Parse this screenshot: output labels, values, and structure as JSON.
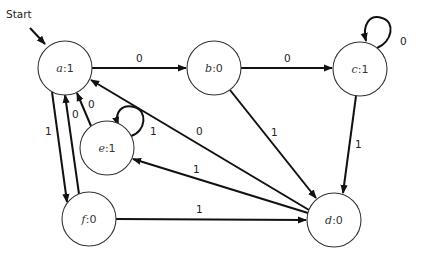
{
  "diagram": {
    "type": "finite-state-machine",
    "start": {
      "label": "Start",
      "target": "a"
    },
    "nodes": [
      {
        "id": "a",
        "name": "a",
        "output": "1",
        "text": ":1",
        "cx": 65,
        "cy": 68
      },
      {
        "id": "b",
        "name": "b",
        "output": "0",
        "text": ":0",
        "cx": 214,
        "cy": 68
      },
      {
        "id": "c",
        "name": "c",
        "output": "1",
        "text": ":1",
        "cx": 360,
        "cy": 69
      },
      {
        "id": "e",
        "name": "e",
        "output": "1",
        "text": ":1",
        "cx": 107,
        "cy": 148
      },
      {
        "id": "f",
        "name": "f",
        "output": "0",
        "text": ":0",
        "cx": 89,
        "cy": 219
      },
      {
        "id": "d",
        "name": "d",
        "output": "0",
        "text": ":0",
        "cx": 334,
        "cy": 220
      }
    ],
    "edges": [
      {
        "from": "a",
        "to": "b",
        "label": "0"
      },
      {
        "from": "a",
        "to": "f",
        "label": "1"
      },
      {
        "from": "b",
        "to": "c",
        "label": "0"
      },
      {
        "from": "b",
        "to": "d",
        "label": "1"
      },
      {
        "from": "c",
        "to": "c",
        "label": "0"
      },
      {
        "from": "c",
        "to": "d",
        "label": "1"
      },
      {
        "from": "d",
        "to": "a",
        "label": "0"
      },
      {
        "from": "d",
        "to": "e",
        "label": "1"
      },
      {
        "from": "e",
        "to": "a",
        "label": "0"
      },
      {
        "from": "e",
        "to": "e",
        "label": "1"
      },
      {
        "from": "f",
        "to": "a",
        "label": "0"
      },
      {
        "from": "f",
        "to": "d",
        "label": "1"
      }
    ]
  }
}
